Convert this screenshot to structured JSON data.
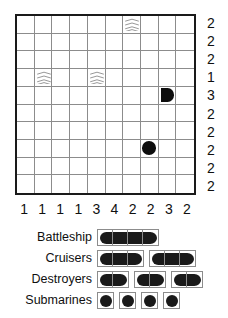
{
  "puzzle": {
    "type": "battleship-solitaire",
    "grid_size": 10,
    "row_clues": [
      2,
      2,
      2,
      1,
      3,
      2,
      2,
      2,
      2,
      2
    ],
    "col_clues": [
      1,
      1,
      1,
      1,
      3,
      4,
      2,
      2,
      3,
      2
    ],
    "given_cells": [
      {
        "row": 1,
        "col": 7,
        "mark": "water"
      },
      {
        "row": 4,
        "col": 2,
        "mark": "water"
      },
      {
        "row": 4,
        "col": 5,
        "mark": "water"
      },
      {
        "row": 5,
        "col": 9,
        "mark": "ship-end-right"
      },
      {
        "row": 8,
        "col": 8,
        "mark": "submarine"
      }
    ],
    "colors": {
      "ship": "#0d0d0d",
      "grid_line": "#8c8c8c",
      "border": "#1a1a1a",
      "background": "#ffffff"
    }
  },
  "fleet": {
    "rows": [
      {
        "label": "Battleship",
        "ships": [
          {
            "length": 4
          }
        ]
      },
      {
        "label": "Cruisers",
        "ships": [
          {
            "length": 3
          },
          {
            "length": 3
          }
        ]
      },
      {
        "label": "Destroyers",
        "ships": [
          {
            "length": 2
          },
          {
            "length": 2
          },
          {
            "length": 2
          }
        ]
      },
      {
        "label": "Submarines",
        "ships": [
          {
            "length": 1
          },
          {
            "length": 1
          },
          {
            "length": 1
          },
          {
            "length": 1
          }
        ]
      }
    ]
  }
}
